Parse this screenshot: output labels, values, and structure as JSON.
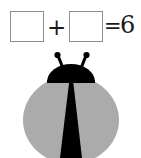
{
  "worksheet": {
    "equation": {
      "operand_1_value": "",
      "operand_1_placeholder": "",
      "plus_symbol": "+",
      "operand_2_value": "",
      "operand_2_placeholder": "",
      "equals_symbol": "=",
      "result": "6",
      "full_text": "□ + □ = 6"
    },
    "illustration": {
      "subject": "ladybug",
      "count_depicted": 6,
      "colors": {
        "body": "#ababab",
        "head": "#000000",
        "wing_split": "#000000",
        "antenna": "#000000",
        "background": "#ffffff",
        "box_border": "#8d8d8d",
        "text": "#1a1a1a"
      }
    }
  }
}
